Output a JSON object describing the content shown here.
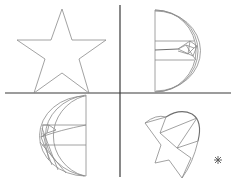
{
  "diagram": {
    "type": "shape-transformation-quadrants",
    "colors": {
      "background": "#ffffff",
      "axis": "#3a3a3a",
      "shape_stroke": "#8a8a8a",
      "marker": "#555555"
    },
    "axes": {
      "horizontal": {
        "x1": 5,
        "y1": 93,
        "x2": 231,
        "y2": 93
      },
      "vertical": {
        "x1": 120,
        "y1": 5,
        "x2": 120,
        "y2": 177
      }
    },
    "quadrants": [
      {
        "position": "top-left",
        "shape": "five-point-star"
      },
      {
        "position": "top-right",
        "shape": "half-disc-with-fan-lines"
      },
      {
        "position": "bottom-left",
        "shape": "mirrored-half-disc-with-fan-lines"
      },
      {
        "position": "bottom-right",
        "shape": "rotated-star-with-arc"
      }
    ],
    "marker": {
      "shape": "asterisk",
      "x": 218,
      "y": 160
    }
  }
}
